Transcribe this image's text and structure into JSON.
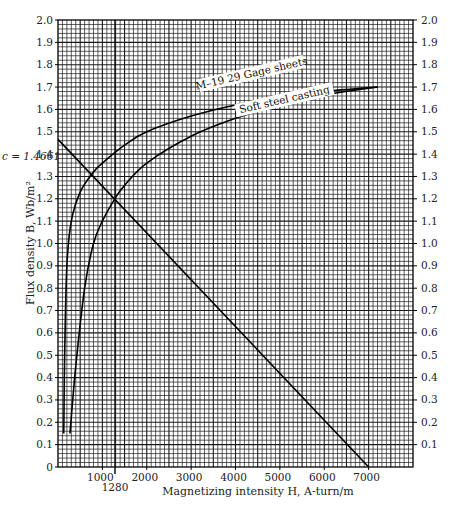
{
  "chart_data": {
    "type": "line",
    "title": "",
    "xlabel": "Magnetizing intensity H, A-turn/m",
    "ylabel": "Flux density B, Wb/m²",
    "xlim": [
      0,
      8000
    ],
    "ylim": [
      0,
      2.0
    ],
    "grid": true,
    "x_ticks": [
      1000,
      2000,
      3000,
      4000,
      5000,
      6000,
      7000
    ],
    "y_ticks": [
      0,
      0.1,
      0.2,
      0.3,
      0.4,
      0.5,
      0.6,
      0.7,
      0.8,
      0.9,
      1.0,
      1.1,
      1.2,
      1.3,
      1.4,
      1.5,
      1.6,
      1.7,
      1.8,
      1.9,
      2.0
    ],
    "series": [
      {
        "name": "M–19 29 Gage sheets",
        "x": [
          130,
          150,
          200,
          300,
          500,
          800,
          1000,
          1500,
          2000,
          3000,
          4000,
          5000,
          6000,
          7200
        ],
        "y": [
          0.15,
          0.5,
          0.9,
          1.1,
          1.23,
          1.32,
          1.36,
          1.44,
          1.5,
          1.57,
          1.62,
          1.655,
          1.68,
          1.7
        ]
      },
      {
        "name": "Soft steel casting",
        "x": [
          270,
          400,
          600,
          800,
          1000,
          1280,
          1500,
          2000,
          3000,
          4000,
          5000,
          6000,
          7200
        ],
        "y": [
          0.15,
          0.45,
          0.8,
          1.0,
          1.1,
          1.2,
          1.26,
          1.36,
          1.48,
          1.56,
          1.62,
          1.665,
          1.7
        ]
      },
      {
        "name": "Load line",
        "x": [
          0,
          7000
        ],
        "y": [
          1.4661,
          0
        ]
      }
    ],
    "annotations": [
      {
        "text": "c = 1.4661",
        "x": 0,
        "y": 1.4661
      },
      {
        "text": "1280",
        "x": 1280,
        "y": 0,
        "note": "vertical line at H = 1280"
      }
    ]
  },
  "labels": {
    "xlabel": "Magnetizing intensity H, A-turn/m",
    "ylabel": "Flux density B, Wb/m²",
    "c_label": "c = 1.4661",
    "h_marker": "1280",
    "curve_m19": "M–19 29 Gage sheets",
    "curve_soft": "Soft steel casting",
    "y_ticks": [
      "0",
      "0.1",
      "0.2",
      "0.3",
      "0.4",
      "0.5",
      "0.6",
      "0.7",
      "0.8",
      "0.9",
      "1.0",
      "1.1",
      "1.2",
      "1.3",
      "1.4",
      "1.5",
      "1.6",
      "1.7",
      "1.8",
      "1.9",
      "2.0"
    ],
    "y_ticks_right": [
      "0.1",
      "0.2",
      "0.3",
      "0.4",
      "0.5",
      "0.6",
      "0.7",
      "0.8",
      "0.9",
      "1.0",
      "1.1",
      "1.2",
      "1.3",
      "1.4",
      "1.5",
      "1.6",
      "1.7",
      "1.8",
      "1.9",
      "2.0"
    ],
    "x_ticks": [
      "1000",
      "2000",
      "3000",
      "4000",
      "5000",
      "6000",
      "7000"
    ]
  }
}
